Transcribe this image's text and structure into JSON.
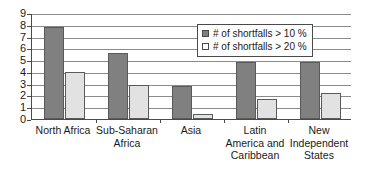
{
  "chart_data": {
    "type": "bar",
    "title": "",
    "xlabel": "",
    "ylabel": "",
    "ylim": [
      0,
      9
    ],
    "yticks": [
      0,
      1,
      2,
      3,
      4,
      5,
      6,
      7,
      8,
      9
    ],
    "ytick_labels": [
      "0",
      "1",
      "2",
      "3",
      "4",
      "5",
      "6",
      "7",
      "8",
      "9"
    ],
    "grid": true,
    "legend_position": "top-right-inside",
    "categories": [
      "North Africa",
      "Sub-Saharan Africa",
      "Asia",
      "Latin America and Caribbean",
      "New Independent States"
    ],
    "series": [
      {
        "name": "# of shortfalls > 10 %",
        "color": "#808080",
        "values": [
          7.8,
          5.6,
          2.8,
          4.8,
          4.8
        ]
      },
      {
        "name": "# of shortfalls > 20 %",
        "color": "#e2e2e2",
        "values": [
          4.0,
          2.9,
          0.4,
          1.7,
          2.2
        ]
      }
    ]
  },
  "legend": {
    "entries": [
      {
        "label": "# of shortfalls > 10 %",
        "swatch": "filled-dark-square-icon"
      },
      {
        "label": "# of shortfalls > 20 %",
        "swatch": "outlined-light-square-icon"
      }
    ]
  },
  "axis": {
    "y_labels": [
      "9",
      "8",
      "7",
      "6",
      "5",
      "4",
      "3",
      "2",
      "1",
      "0"
    ],
    "x_labels": [
      {
        "lines": [
          "North Africa"
        ]
      },
      {
        "lines": [
          "Sub-Saharan",
          "Africa"
        ]
      },
      {
        "lines": [
          "Asia"
        ]
      },
      {
        "lines": [
          "Latin",
          "America and",
          "Caribbean"
        ]
      },
      {
        "lines": [
          "New",
          "Independent",
          "States"
        ]
      }
    ]
  }
}
